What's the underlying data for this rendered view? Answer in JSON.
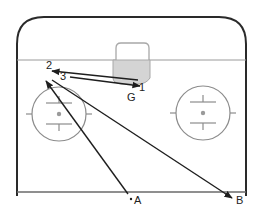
{
  "diagram": {
    "type": "hockey-drill",
    "colors": {
      "rink_outline": "#2a2a2a",
      "markings": "#8c8c8c",
      "crease_fill": "#d4d4d4",
      "arrows": "#1e1e1e",
      "background": "#ffffff"
    },
    "labels": {
      "player_2": "2",
      "player_3": "3",
      "player_1": "1",
      "goalie": "G",
      "point_a": "A",
      "point_b": "B"
    },
    "passes": [
      {
        "from": "1",
        "to": "2"
      },
      {
        "from": "3",
        "to": "1"
      },
      {
        "from": "A",
        "to": "2-area"
      },
      {
        "from": "2-area",
        "to": "B"
      }
    ],
    "elements": {
      "faceoff_circles": [
        "left",
        "right"
      ],
      "net": "top-center",
      "goal_line": "horizontal",
      "blue_line": "bottom"
    }
  }
}
